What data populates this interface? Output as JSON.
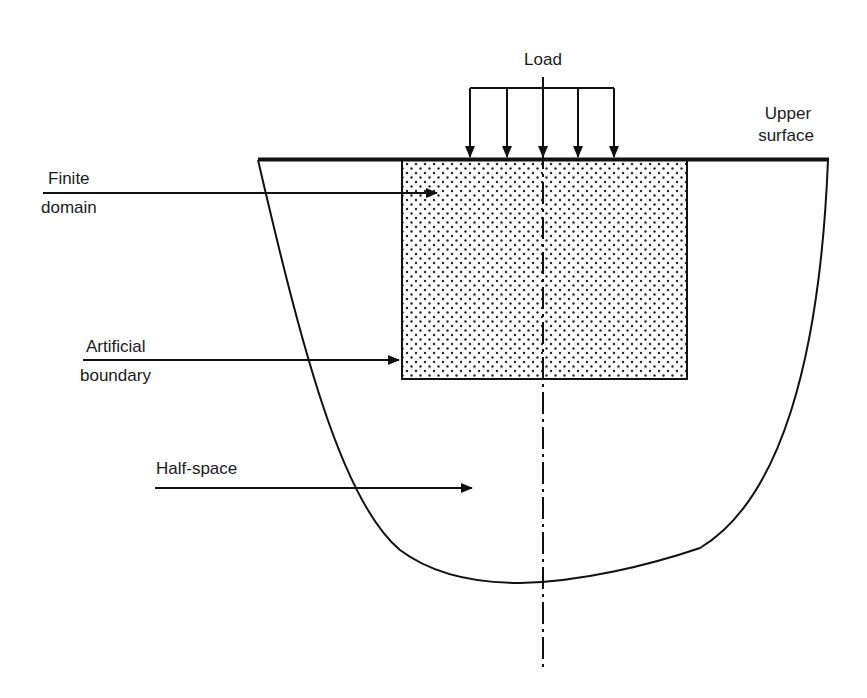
{
  "diagram": {
    "labels": {
      "load": "Load",
      "upper_surface_line1": "Upper",
      "upper_surface_line2": "surface",
      "finite_domain_line1": "Finite",
      "finite_domain_line2": "domain",
      "artificial_boundary_line1": "Artificial",
      "artificial_boundary_line2": "boundary",
      "half_space": "Half-space"
    },
    "colors": {
      "stroke": "#111111",
      "dot_fill": "#222222",
      "background": "#ffffff"
    },
    "elements": {
      "load_arrow_count": 5,
      "finite_domain_fill": "stippled",
      "axis_style": "dash-dot centerline"
    }
  }
}
